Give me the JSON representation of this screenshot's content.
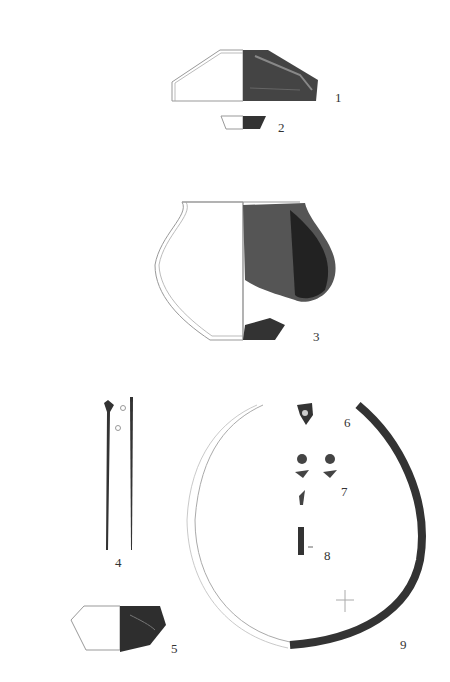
{
  "plate": {
    "labels": {
      "f1": "1",
      "f2": "2",
      "f3": "3",
      "f4": "4",
      "f5": "5",
      "f6": "6",
      "f7": "7",
      "f8": "8",
      "f9": "9"
    }
  },
  "colors": {
    "outline": "#999999",
    "fill_dark": "#2b2b2b",
    "fill_mid": "#555555"
  }
}
